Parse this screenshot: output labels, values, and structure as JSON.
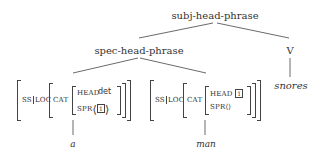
{
  "tree": {
    "root": {
      "label": "subj-head-phrase"
    },
    "spec_head": {
      "label": "spec-head-phrase"
    },
    "verb": {
      "category": "V",
      "word": "snores"
    },
    "left_leaf": {
      "path_ss": "SS",
      "path_loc": "LOC",
      "cat": "CAT",
      "head_label": "HEAD",
      "head_value": "det",
      "spr_label": "SPR",
      "spr_open": "⟨",
      "spr_tag": "1",
      "spr_close": "⟩",
      "word": "a"
    },
    "right_leaf": {
      "path_ss": "SS",
      "path_loc": "LOC",
      "cat": "CAT",
      "head_label": "HEAD",
      "head_tag": "1",
      "spr_label": "SPR",
      "spr_value": "⟨⟩",
      "word": "man"
    }
  }
}
